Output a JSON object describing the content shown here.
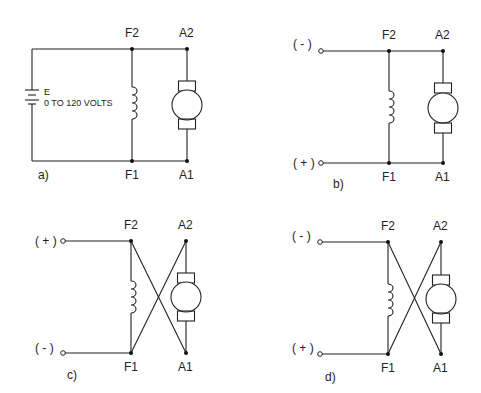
{
  "diagram": {
    "type": "dc-shunt-motor-connections",
    "panels": [
      {
        "id": "a",
        "caption": "a)",
        "source": {
          "type": "battery",
          "label": "E",
          "rating": "0 TO 120 VOLTS"
        },
        "labels": {
          "f2": "F2",
          "a2": "A2",
          "f1": "F1",
          "a1": "A1"
        },
        "crossed": false
      },
      {
        "id": "b",
        "caption": "b)",
        "terminals": {
          "top": "( - )",
          "bottom": "( + )"
        },
        "labels": {
          "f2": "F2",
          "a2": "A2",
          "f1": "F1",
          "a1": "A1"
        },
        "crossed": false
      },
      {
        "id": "c",
        "caption": "c)",
        "terminals": {
          "top": "( + )",
          "bottom": "( - )"
        },
        "labels": {
          "f2": "F2",
          "a2": "A2",
          "f1": "F1",
          "a1": "A1"
        },
        "crossed": true
      },
      {
        "id": "d",
        "caption": "d)",
        "terminals": {
          "top": "( - )",
          "bottom": "( + )"
        },
        "labels": {
          "f2": "F2",
          "a2": "A2",
          "f1": "F1",
          "a1": "A1"
        },
        "crossed": true
      }
    ]
  }
}
